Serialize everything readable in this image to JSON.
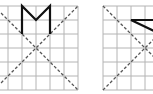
{
  "figure": {
    "colors": {
      "grid": "#b4b4b4",
      "dashed": "#555555",
      "figure": "#111111",
      "background": "#ffffff"
    },
    "cell_size": 14,
    "grids": [
      {
        "name": "left-grid",
        "x0": -6,
        "y0": 6,
        "cols": 6,
        "rows": 6,
        "diagonal_center": [
          36,
          48
        ],
        "figure_shape": "M-shape",
        "figure_points": [
          [
            22,
            34
          ],
          [
            22,
            6
          ],
          [
            36,
            20
          ],
          [
            50,
            6
          ],
          [
            50,
            34
          ]
        ]
      },
      {
        "name": "right-grid",
        "x0": 103,
        "y0": 6,
        "cols": 4,
        "rows": 6,
        "diagonal_center": [
          145,
          48
        ],
        "figure_shape": "angle-shape",
        "figure_points": [
          [
            156,
            20
          ],
          [
            131,
            20
          ],
          [
            156,
            32
          ]
        ]
      }
    ]
  }
}
